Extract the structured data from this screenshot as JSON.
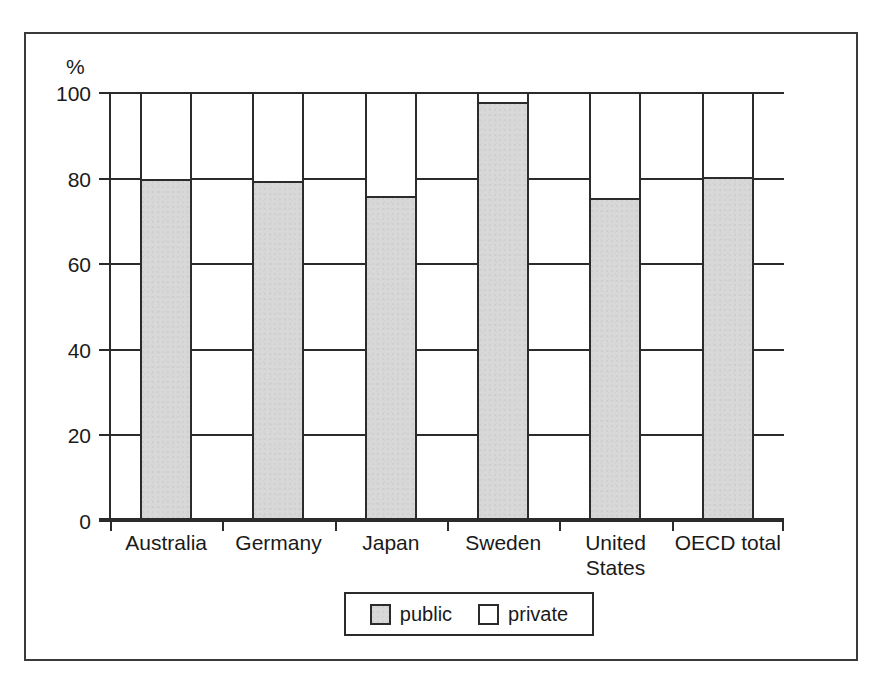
{
  "chart_data": {
    "type": "bar",
    "subtype": "stacked-100-percent",
    "title": "",
    "xlabel": "",
    "ylabel": "",
    "unit_label": "%",
    "ylim": [
      0,
      100
    ],
    "yticks": [
      100,
      80,
      60,
      40,
      20,
      0
    ],
    "ytick_labels": [
      "100",
      "80",
      "60",
      "40",
      "20",
      "0"
    ],
    "grid": true,
    "grid_axis": "y",
    "legend_position": "bottom-center",
    "categories": [
      "Australia",
      "Germany",
      "Japan",
      "Sweden",
      "United States",
      "OECD total"
    ],
    "category_lines": [
      [
        "Australia"
      ],
      [
        "Germany"
      ],
      [
        "Japan"
      ],
      [
        "Sweden"
      ],
      [
        "United",
        "States"
      ],
      [
        "OECD total"
      ]
    ],
    "series": [
      {
        "name": "public",
        "color": "#d8d8d8",
        "values": [
          80.0,
          79.5,
          76.0,
          98.0,
          75.5,
          80.5
        ]
      },
      {
        "name": "private",
        "color": "#ffffff",
        "values": [
          20.0,
          20.5,
          24.0,
          2.0,
          24.5,
          19.5
        ]
      }
    ]
  },
  "legend": {
    "entries": [
      {
        "label": "public"
      },
      {
        "label": "private"
      }
    ]
  },
  "colors": {
    "public_fill": "#d8d8d8",
    "private_fill": "#ffffff",
    "line": "#2b2b2b",
    "frame": "#3a3a3a",
    "text": "#1a1a1a",
    "background": "#ffffff"
  }
}
